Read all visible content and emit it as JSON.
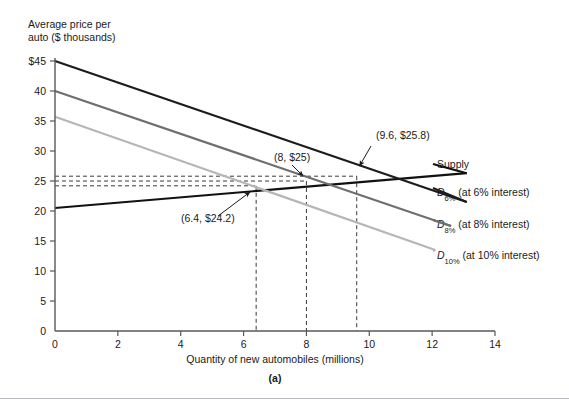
{
  "figure": {
    "panel_caption": "(a)",
    "divider_color": "#b9b9bf"
  },
  "axes": {
    "y_title_line1": "Average price per",
    "y_title_line2": "auto ($ thousands)",
    "x_title": "Quantity of new automobiles (millions)",
    "y_ticks": [
      "$45",
      "40",
      "35",
      "30",
      "25",
      "20",
      "15",
      "10",
      "5",
      "0"
    ],
    "y_tick_values": [
      45,
      40,
      35,
      30,
      25,
      20,
      15,
      10,
      5,
      0
    ],
    "x_ticks": [
      "0",
      "2",
      "4",
      "6",
      "8",
      "10",
      "12",
      "14"
    ],
    "x_tick_values": [
      0,
      2,
      4,
      6,
      8,
      10,
      12,
      14
    ],
    "x_range": [
      0,
      14
    ],
    "y_range": [
      0,
      45
    ],
    "axis_color": "#58585c"
  },
  "curves": {
    "supply": {
      "label": "Supply",
      "color": "#111111"
    },
    "d6": {
      "label_main": "D",
      "label_sub": "6%",
      "label_rest": " (at 6% interest)",
      "color": "#1c1c1c"
    },
    "d8": {
      "label_main": "D",
      "label_sub": "8%",
      "label_rest": " (at 8% interest)",
      "color": "#6f6f72"
    },
    "d10": {
      "label_main": "D",
      "label_sub": "10%",
      "label_rest": " (at 10% interest)",
      "color": "#b6b6ba"
    }
  },
  "annotations": [
    {
      "name": "equilibrium-d6",
      "text": "(9.6, $25.8)"
    },
    {
      "name": "equilibrium-d8",
      "text": "(8, $25)"
    },
    {
      "name": "equilibrium-d10",
      "text": "(6.4, $24.2)"
    }
  ],
  "chart_data": {
    "type": "line",
    "title": "",
    "xlabel": "Quantity of new automobiles (millions)",
    "ylabel": "Average price per auto ($ thousands)",
    "xlim": [
      0,
      14
    ],
    "ylim": [
      0,
      45
    ],
    "xticks": [
      0,
      2,
      4,
      6,
      8,
      10,
      12,
      14
    ],
    "yticks": [
      0,
      5,
      10,
      15,
      20,
      25,
      30,
      35,
      40,
      45
    ],
    "grid": false,
    "legend": "right-of-plot (inline curve labels)",
    "series": [
      {
        "name": "Supply",
        "color": "#111111",
        "points": [
          [
            0,
            20.5
          ],
          [
            13.1,
            26.3
          ]
        ]
      },
      {
        "name": "D6% (at 6% interest)",
        "color": "#1c1c1c",
        "points": [
          [
            0,
            45.0
          ],
          [
            13.1,
            21.5
          ]
        ]
      },
      {
        "name": "D8% (at 8% interest)",
        "color": "#6f6f72",
        "points": [
          [
            0,
            40.0
          ],
          [
            12.6,
            17.5
          ]
        ]
      },
      {
        "name": "D10% (at 10% interest)",
        "color": "#b6b6ba",
        "points": [
          [
            0,
            35.7
          ],
          [
            12.1,
            13.5
          ]
        ]
      }
    ],
    "equilibria": [
      {
        "label": "(9.6, $25.8)",
        "x": 9.6,
        "y": 25.8,
        "demand": "D6%"
      },
      {
        "label": "(8, $25)",
        "x": 8,
        "y": 25,
        "demand": "D8%"
      },
      {
        "label": "(6.4, $24.2)",
        "x": 6.4,
        "y": 24.2,
        "demand": "D10%"
      }
    ],
    "guides": {
      "horizontal_dashed_y": [
        25.8,
        25.0,
        24.2
      ],
      "vertical_dashed_x": [
        6.4,
        8.0,
        9.6
      ]
    }
  }
}
